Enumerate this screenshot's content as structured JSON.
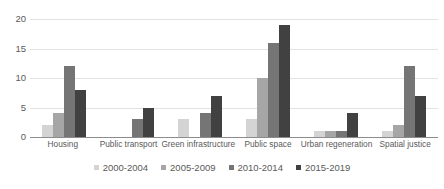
{
  "chart_data": {
    "type": "bar",
    "title": "",
    "xlabel": "",
    "ylabel": "",
    "ylim": [
      0,
      20
    ],
    "yticks": [
      0,
      5,
      10,
      15,
      20
    ],
    "grid": true,
    "legend_position": "bottom",
    "categories": [
      "Housing",
      "Public transport",
      "Green infrastructure",
      "Public space",
      "Urban regeneration",
      "Spatial justice"
    ],
    "series": [
      {
        "name": "2000-2004",
        "color": "#d4d4d4",
        "values": [
          2,
          0,
          3,
          3,
          1,
          1
        ]
      },
      {
        "name": "2005-2009",
        "color": "#a6a6a6",
        "values": [
          4,
          0,
          0,
          10,
          1,
          2
        ]
      },
      {
        "name": "2010-2014",
        "color": "#757575",
        "values": [
          12,
          3,
          4,
          16,
          1,
          12
        ]
      },
      {
        "name": "2015-2019",
        "color": "#414141",
        "values": [
          8,
          5,
          7,
          19,
          4,
          7
        ]
      }
    ]
  },
  "axis": {
    "y_tick_labels": [
      "0",
      "5",
      "10",
      "15",
      "20"
    ]
  }
}
